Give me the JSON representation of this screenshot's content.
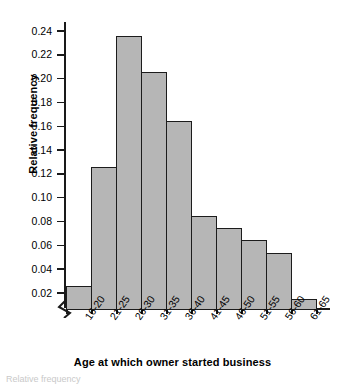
{
  "figure": {
    "background_color": "#ffffff",
    "caption_fragment": "Relative frequency"
  },
  "axes": {
    "y_title": "Relative frequency",
    "x_title": "Age at which owner started business",
    "y_ticks": [
      "0.24",
      "0.22",
      "0.20",
      "0.18",
      "0.16",
      "0.14",
      "0.12",
      "0.10",
      "0.08",
      "0.06",
      "0.04",
      "0.02"
    ],
    "axis_break_symbol": "zigzag-break-icon"
  },
  "chart_data": {
    "type": "bar",
    "title": "",
    "subtitle": "",
    "xlabel": "Age at which owner started business",
    "ylabel": "Relative frequency",
    "categories": [
      "16-20",
      "21-25",
      "26-30",
      "31-35",
      "36-40",
      "41-45",
      "46-50",
      "51-55",
      "56-60",
      "61-65"
    ],
    "values": [
      0.02,
      0.12,
      0.23,
      0.2,
      0.159,
      0.079,
      0.069,
      0.059,
      0.048,
      0.009
    ],
    "ylim": [
      0,
      0.25
    ],
    "y_tick_values": [
      0.02,
      0.04,
      0.06,
      0.08,
      0.1,
      0.12,
      0.14,
      0.16,
      0.18,
      0.2,
      0.22,
      0.24
    ],
    "grid": false,
    "legend": false,
    "legend_position": "none",
    "bar_fill_color": "#b6b6b6",
    "bar_edge_color": "#1c1c1c",
    "axis_color": "#1a1a1a",
    "y_axis_broken": true,
    "annotations": []
  }
}
